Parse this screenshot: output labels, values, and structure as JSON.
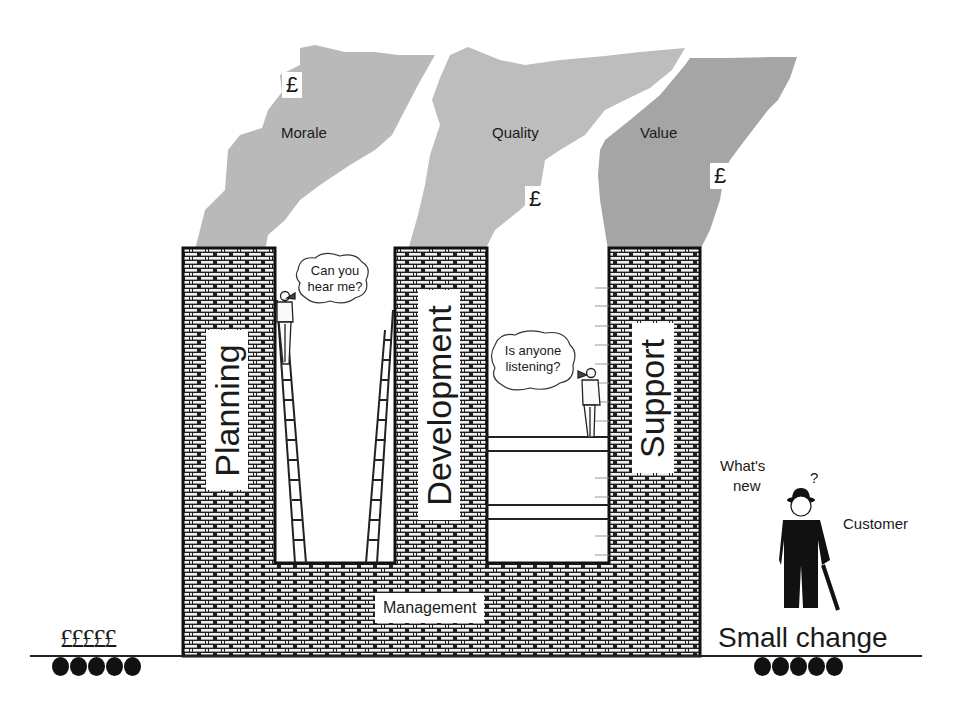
{
  "diagram": {
    "clouds": [
      {
        "label": "Morale",
        "currency": "£"
      },
      {
        "label": "Quality",
        "currency": "£"
      },
      {
        "label": "Value",
        "currency": "£"
      }
    ],
    "towers": [
      {
        "label": "Planning"
      },
      {
        "label": "Development"
      },
      {
        "label": "Support"
      }
    ],
    "base": {
      "label": "Management"
    },
    "speech_bubbles": [
      {
        "line1": "Can you",
        "line2": "hear me?"
      },
      {
        "line1": "Is anyone",
        "line2": "listening?"
      }
    ],
    "customer": {
      "label": "Customer",
      "thought_line1": "What's",
      "thought_line2": "new",
      "question_mark": "?"
    },
    "left_money": {
      "symbols": "£££££",
      "coin_count": 5
    },
    "right_money": {
      "label": "Small change",
      "coin_count": 5
    },
    "colors": {
      "cloud_light": "#b9b9b9",
      "cloud_dark": "#a3a3a3",
      "brick_mortar": "#1a1a1a",
      "brick_fill": "#f2f2f2",
      "ink": "#1a1a1a"
    }
  }
}
